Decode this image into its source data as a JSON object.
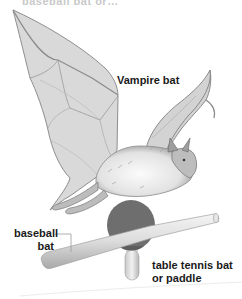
{
  "figure": {
    "top_text_cropped": "baseball bat or…",
    "labels": {
      "vampire_bat": "Vampire bat",
      "baseball_bat_line1": "baseball",
      "baseball_bat_line2": "bat",
      "table_tennis_line1": "table tennis bat",
      "table_tennis_line2": "or paddle"
    },
    "colors": {
      "wing_fill": "#d8d8d8",
      "wing_stroke": "#8a8a8a",
      "body_fur": "#eeeeee",
      "paddle_face": "#6e6e6e",
      "baseball_bat": "#dcdcdc",
      "leader_line": "#9a9a9a",
      "text": "#1a1a1a"
    }
  }
}
